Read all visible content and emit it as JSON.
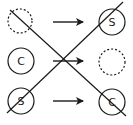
{
  "diagram": {
    "colors": {
      "stroke": "#1a1a1a",
      "background": "#ffffff"
    },
    "rows": [
      {
        "left": {
          "label": "",
          "style": "dashed",
          "cx": 20,
          "cy": 21,
          "r": 12
        },
        "arrow": {
          "x1": 53,
          "x2": 83,
          "y": 22
        },
        "right": {
          "label": "S",
          "style": "solid",
          "cx": 112,
          "cy": 22,
          "r": 13
        }
      },
      {
        "left": {
          "label": "C",
          "style": "solid",
          "cx": 21,
          "cy": 61,
          "r": 13
        },
        "arrow": {
          "x1": 53,
          "x2": 83,
          "y": 61
        },
        "right": {
          "label": "",
          "style": "dashed",
          "cx": 112,
          "cy": 62,
          "r": 13
        }
      },
      {
        "left": {
          "label": "S",
          "style": "solid",
          "cx": 21,
          "cy": 101,
          "r": 13
        },
        "arrow": {
          "x1": 53,
          "x2": 83,
          "y": 101
        },
        "right": {
          "label": "C",
          "style": "solid",
          "cx": 112,
          "cy": 102,
          "r": 13
        }
      }
    ],
    "cross_lines": [
      {
        "x1": 10,
        "y1": 10,
        "x2": 126,
        "y2": 116
      },
      {
        "x1": 7,
        "y1": 113,
        "x2": 123,
        "y2": 2
      }
    ]
  }
}
